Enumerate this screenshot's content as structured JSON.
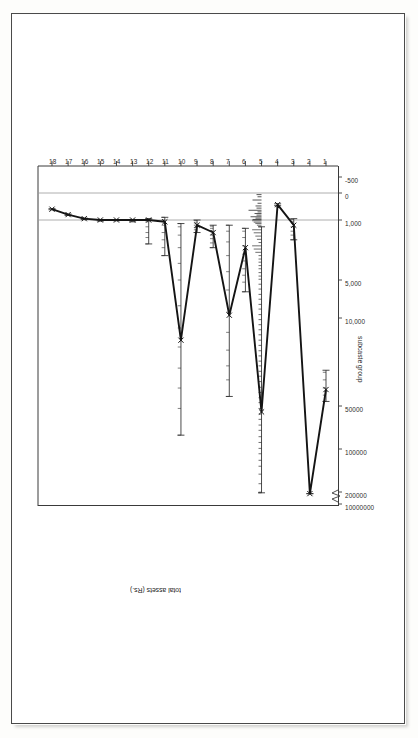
{
  "figure": {
    "kind": "scanned-statistical-figure",
    "orientation": "rotated-90-on-page",
    "paper_color": "#ffffff",
    "ink_color": "#262626"
  },
  "chart_data": {
    "type": "line",
    "title": "",
    "subtitle": "",
    "xlabel": "subcaste group",
    "ylabel": "total assets (Rs.)",
    "yscale": "log",
    "grid": false,
    "legend": null,
    "x": [
      1,
      2,
      3,
      4,
      5,
      6,
      7,
      8,
      9,
      10,
      11,
      12,
      13,
      14,
      15,
      16,
      17,
      18
    ],
    "xtick_labels": [
      "1",
      "2",
      "3",
      "4",
      "5",
      "6",
      "7",
      "8",
      "9",
      "10",
      "11",
      "12",
      "13",
      "14",
      "15",
      "16",
      "17",
      "18"
    ],
    "ytick_labels": [
      "10000000",
      "200000",
      "100000",
      "50000",
      "10,000",
      "5,000",
      "1,000",
      "0",
      "-500"
    ],
    "ytick_values": [
      10000000,
      200000,
      100000,
      50000,
      10000,
      5000,
      1000,
      0,
      -500
    ],
    "axis_break": true,
    "axis_break_symbol": "zigzag",
    "series": [
      {
        "name": "mean total assets",
        "marker": "x",
        "values": [
          37000,
          340000,
          1150,
          430,
          55000,
          2100,
          9500,
          1400,
          1150,
          15000,
          1050,
          1000,
          1000,
          1000,
          1000,
          950,
          800,
          600
        ]
      }
    ],
    "error_bars": {
      "present": true,
      "style": "horizontal-whisker-on-rotated-axes",
      "per_group": [
        {
          "group": 1,
          "low": 26000,
          "high": 46000
        },
        {
          "group": 2,
          "low": 330000,
          "high": 355000
        },
        {
          "group": 3,
          "low": 950,
          "high": 1700
        },
        {
          "group": 4,
          "low": 400,
          "high": 470
        },
        {
          "group": 5,
          "low": 1200,
          "high": 260000
        },
        {
          "group": 6,
          "low": 1250,
          "high": 6200
        },
        {
          "group": 7,
          "low": 1150,
          "high": 42000
        },
        {
          "group": 8,
          "low": 1150,
          "high": 2100
        },
        {
          "group": 9,
          "low": 1000,
          "high": 1400
        },
        {
          "group": 10,
          "low": 1100,
          "high": 80000
        },
        {
          "group": 11,
          "low": 900,
          "high": 2600
        },
        {
          "group": 12,
          "low": 950,
          "high": 1900
        },
        {
          "group": 13,
          "low": 980,
          "high": 1050
        },
        {
          "group": 14,
          "low": 990,
          "high": 1020
        },
        {
          "group": 15,
          "low": 980,
          "high": 1030
        },
        {
          "group": 16,
          "low": 930,
          "high": 980
        },
        {
          "group": 17,
          "low": 780,
          "high": 830
        },
        {
          "group": 18,
          "low": 580,
          "high": 620
        }
      ]
    },
    "rug_marks": {
      "present": true,
      "description": "dense individual observation ticks along group 5 and lighter ticks along groups 1-12",
      "groups_with_rug": [
        1,
        3,
        5,
        6,
        7,
        8,
        9,
        10,
        11,
        12
      ]
    }
  },
  "axes": {
    "x_axis_title": "subcaste group",
    "y_axis_title": "total assets (Rs.)"
  }
}
